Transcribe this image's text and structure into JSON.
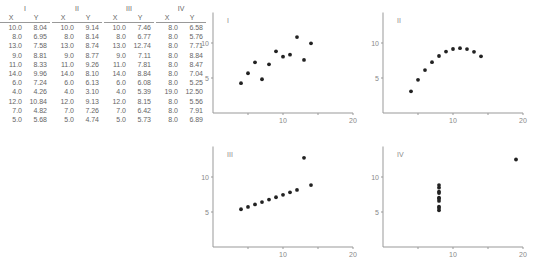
{
  "tables": [
    {
      "title": "I",
      "headers": [
        "X",
        "Y"
      ],
      "rows": [
        [
          "10.0",
          "8.04"
        ],
        [
          "8.0",
          "6.95"
        ],
        [
          "13.0",
          "7.58"
        ],
        [
          "9.0",
          "8.81"
        ],
        [
          "11.0",
          "8.33"
        ],
        [
          "14.0",
          "9.96"
        ],
        [
          "6.0",
          "7.24"
        ],
        [
          "4.0",
          "4.26"
        ],
        [
          "12.0",
          "10.84"
        ],
        [
          "7.0",
          "4.82"
        ],
        [
          "5.0",
          "5.68"
        ]
      ]
    },
    {
      "title": "II",
      "headers": [
        "X",
        "Y"
      ],
      "rows": [
        [
          "10.0",
          "9.14"
        ],
        [
          "8.0",
          "8.14"
        ],
        [
          "13.0",
          "8.74"
        ],
        [
          "9.0",
          "8.77"
        ],
        [
          "11.0",
          "9.26"
        ],
        [
          "14.0",
          "8.10"
        ],
        [
          "6.0",
          "6.13"
        ],
        [
          "4.0",
          "3.10"
        ],
        [
          "12.0",
          "9.13"
        ],
        [
          "7.0",
          "7.26"
        ],
        [
          "5.0",
          "4.74"
        ]
      ]
    },
    {
      "title": "III",
      "headers": [
        "X",
        "Y"
      ],
      "rows": [
        [
          "10.0",
          "7.46"
        ],
        [
          "8.0",
          "6.77"
        ],
        [
          "13.0",
          "12.74"
        ],
        [
          "9.0",
          "7.11"
        ],
        [
          "11.0",
          "7.81"
        ],
        [
          "14.0",
          "8.84"
        ],
        [
          "6.0",
          "6.08"
        ],
        [
          "4.0",
          "5.39"
        ],
        [
          "12.0",
          "8.15"
        ],
        [
          "7.0",
          "6.42"
        ],
        [
          "5.0",
          "5.73"
        ]
      ]
    },
    {
      "title": "IV",
      "headers": [
        "X",
        "Y"
      ],
      "rows": [
        [
          "8.0",
          "6.58"
        ],
        [
          "8.0",
          "5.76"
        ],
        [
          "8.0",
          "7.71"
        ],
        [
          "8.0",
          "8.84"
        ],
        [
          "8.0",
          "8.47"
        ],
        [
          "8.0",
          "7.04"
        ],
        [
          "8.0",
          "5.25"
        ],
        [
          "19.0",
          "12.50"
        ],
        [
          "8.0",
          "5.56"
        ],
        [
          "8.0",
          "7.91"
        ],
        [
          "8.0",
          "6.89"
        ]
      ]
    }
  ],
  "chart_data": [
    {
      "type": "scatter",
      "title": "I",
      "xlim": [
        0,
        20
      ],
      "ylim": [
        0,
        13.5
      ],
      "xticks": [
        5,
        10,
        15,
        20
      ],
      "xtick_labels": [
        "",
        "10",
        "",
        "20"
      ],
      "yticks": [
        5,
        10
      ],
      "ytick_labels": [
        "5",
        "10"
      ],
      "grid": false,
      "x": [
        10,
        8,
        13,
        9,
        11,
        14,
        6,
        4,
        12,
        7,
        5
      ],
      "y": [
        8.04,
        6.95,
        7.58,
        8.81,
        8.33,
        9.96,
        7.24,
        4.26,
        10.84,
        4.82,
        5.68
      ]
    },
    {
      "type": "scatter",
      "title": "II",
      "xlim": [
        0,
        20
      ],
      "ylim": [
        0,
        13.5
      ],
      "xticks": [
        5,
        10,
        15,
        20
      ],
      "xtick_labels": [
        "",
        "10",
        "",
        "20"
      ],
      "yticks": [
        5,
        10
      ],
      "ytick_labels": [
        "5",
        "10"
      ],
      "grid": false,
      "x": [
        10,
        8,
        13,
        9,
        11,
        14,
        6,
        4,
        12,
        7,
        5
      ],
      "y": [
        9.14,
        8.14,
        8.74,
        8.77,
        9.26,
        8.1,
        6.13,
        3.1,
        9.13,
        7.26,
        4.74
      ]
    },
    {
      "type": "scatter",
      "title": "III",
      "xlim": [
        0,
        20
      ],
      "ylim": [
        0,
        13.5
      ],
      "xticks": [
        5,
        10,
        15,
        20
      ],
      "xtick_labels": [
        "",
        "10",
        "",
        "20"
      ],
      "yticks": [
        5,
        10
      ],
      "ytick_labels": [
        "5",
        "10"
      ],
      "grid": false,
      "x": [
        10,
        8,
        13,
        9,
        11,
        14,
        6,
        4,
        12,
        7,
        5
      ],
      "y": [
        7.46,
        6.77,
        12.74,
        7.11,
        7.81,
        8.84,
        6.08,
        5.39,
        8.15,
        6.42,
        5.73
      ]
    },
    {
      "type": "scatter",
      "title": "IV",
      "xlim": [
        0,
        20
      ],
      "ylim": [
        0,
        13.5
      ],
      "xticks": [
        5,
        10,
        15,
        20
      ],
      "xtick_labels": [
        "",
        "10",
        "",
        "20"
      ],
      "yticks": [
        5,
        10
      ],
      "ytick_labels": [
        "5",
        "10"
      ],
      "grid": false,
      "x": [
        8,
        8,
        8,
        8,
        8,
        8,
        8,
        19,
        8,
        8,
        8
      ],
      "y": [
        6.58,
        5.76,
        7.71,
        8.84,
        8.47,
        7.04,
        5.25,
        12.5,
        5.56,
        7.91,
        6.89
      ]
    }
  ]
}
